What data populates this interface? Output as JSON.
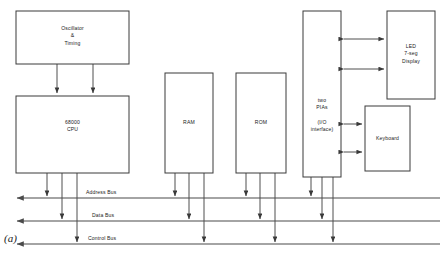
{
  "figure": {
    "caption": "(a)",
    "blocks": [
      {
        "id": "oscillator",
        "label": "Oscillator\n&\nTiming",
        "x": 16,
        "y": 11,
        "w": 113,
        "h": 53
      },
      {
        "id": "cpu",
        "label": "68000\nCPU",
        "x": 16,
        "y": 96,
        "w": 113,
        "h": 77
      },
      {
        "id": "ram",
        "label": "RAM",
        "x": 165,
        "y": 73,
        "w": 48,
        "h": 100
      },
      {
        "id": "rom",
        "label": "ROM",
        "x": 236,
        "y": 73,
        "w": 50,
        "h": 100
      },
      {
        "id": "pia",
        "label": "two\nPIAs\n\n(I/O\ninterface)",
        "x": 303,
        "y": 11,
        "w": 38,
        "h": 166
      },
      {
        "id": "led-display",
        "label": "LED\n7-seg\nDisplay",
        "x": 387,
        "y": 11,
        "w": 48,
        "h": 88
      },
      {
        "id": "keyboard",
        "label": "Keyboard",
        "x": 365,
        "y": 106,
        "w": 45,
        "h": 65
      }
    ],
    "buses": [
      {
        "id": "address-bus",
        "label": "Address Bus",
        "y": 198,
        "label_x": 86,
        "label_y": 189
      },
      {
        "id": "data-bus",
        "label": "Data Bus",
        "y": 221,
        "label_x": 92,
        "label_y": 212
      },
      {
        "id": "control-bus",
        "label": "Control Bus",
        "y": 244,
        "label_x": 88,
        "label_y": 235
      }
    ],
    "colors": {
      "stroke": "#3a3a3a",
      "bus_stroke": "#4a4a4a",
      "text": "#1a1a1a",
      "background": "#ffffff"
    }
  }
}
